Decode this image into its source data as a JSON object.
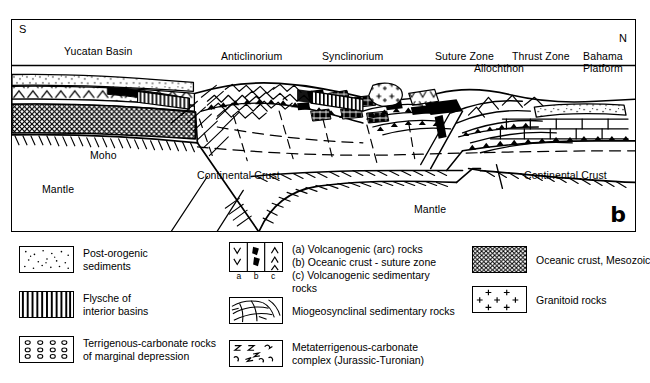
{
  "panel": {
    "letter": "b",
    "orientation": {
      "left": "S",
      "right": "N"
    },
    "surface_labels": [
      {
        "id": "yucatan-basin",
        "text": "Yucatan Basin",
        "x": 52,
        "y": 26
      },
      {
        "id": "anticlinorium",
        "text": "Anticlinorium",
        "x": 209,
        "y": 31
      },
      {
        "id": "synclinorium",
        "text": "Synclinorium",
        "x": 310,
        "y": 31
      },
      {
        "id": "suture-zone",
        "text": "Suture Zone",
        "x": 428,
        "y": 31
      },
      {
        "id": "thrust-zone",
        "text": "Thrust Zone",
        "x": 512,
        "y": 31
      },
      {
        "id": "allochthon",
        "text": "Allochthon",
        "x": 470,
        "y": 43
      },
      {
        "id": "bahama-platform",
        "text": "Bahama\nPlatform",
        "x": 585,
        "y": 31
      }
    ],
    "interior_labels": [
      {
        "id": "moho",
        "text": "Moho",
        "x": 88,
        "y": 136
      },
      {
        "id": "mantle-left",
        "text": "Mantle",
        "x": 40,
        "y": 170
      },
      {
        "id": "continental-crust-left",
        "text": "Continental Crust",
        "x": 195,
        "y": 156
      },
      {
        "id": "continental-crust-right",
        "text": "Continental Crust",
        "x": 520,
        "y": 156
      },
      {
        "id": "mantle-right",
        "text": "Mantle",
        "x": 410,
        "y": 207
      }
    ]
  },
  "legend": {
    "columns": [
      {
        "id": "legend-column-left",
        "items": [
          {
            "id": "post-orogenic-sediments",
            "pattern": "stipple",
            "label": "Post-orogenic\nsediments"
          },
          {
            "id": "flysche-interior-basins",
            "pattern": "vertical-stripes",
            "label": "Flysche of\ninterior basins"
          },
          {
            "id": "terrigenous-carbonate-rocks",
            "pattern": "circles",
            "label": "Terrigenous-carbonate rocks\nof marginal depression"
          }
        ]
      },
      {
        "id": "legend-column-middle",
        "items": [
          {
            "id": "volcanogenic-oceanic-abc",
            "pattern": "abc-triple",
            "sublabels": [
              "a",
              "b",
              "c"
            ],
            "label": "(a) Volcanogenic (arc) rocks\n(b) Oceanic crust - suture zone\n(c) Volcanogenic sedimentary\n      rocks"
          },
          {
            "id": "miogeosynclinal-sedimentary-rocks",
            "pattern": "curved-lines",
            "label": "Miogeosynclinal sedimentary rocks"
          },
          {
            "id": "metaterrigenous-carbonate-complex",
            "pattern": "squiggles",
            "label": "Metaterrigenous-carbonate\ncomplex (Jurassic-Turonian)"
          }
        ]
      },
      {
        "id": "legend-column-right",
        "items": [
          {
            "id": "oceanic-crust-mesozoic",
            "pattern": "crosshatch",
            "label": "Oceanic crust, Mesozoic"
          },
          {
            "id": "granitoid-rocks",
            "pattern": "plus-signs",
            "label": "Granitoid rocks"
          }
        ]
      }
    ]
  },
  "colors": {
    "ink": "#000000",
    "paper": "#ffffff",
    "shade": "#b9b9b9"
  }
}
